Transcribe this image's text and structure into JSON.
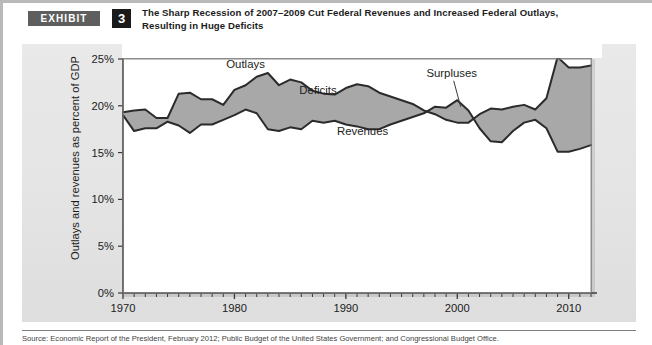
{
  "exhibit": {
    "tag_label": "EXHIBIT",
    "number": "3",
    "title_line1": "The Sharp Recession of 2007–2009 Cut Federal Revenues and Increased Federal Outlays,",
    "title_line2": "Resulting in Huge Deficits"
  },
  "source": {
    "text": "Source: Economic Report of the President, February 2012; Public Budget of the United States Government; and Congressional Budget Office."
  },
  "colors": {
    "fill_gray": "#a8a8a8",
    "line_dark": "#2b2b2b",
    "panel_bg": "#e6e6e6",
    "plot_bg": "#ffffff",
    "frame": "#8c8c8c",
    "tag_bg": "#5e5e5e",
    "num_bg": "#1a1a1a"
  },
  "chart_data": {
    "type": "area",
    "title": "The Sharp Recession of 2007–2009 Cut Federal Revenues and Increased Federal Outlays, Resulting in Huge Deficits",
    "xlabel": "",
    "ylabel": "Outlays and revenues as percent of GDP",
    "xlim": [
      1970,
      2012
    ],
    "ylim": [
      0,
      25
    ],
    "ytick_values": [
      0,
      5,
      10,
      15,
      20,
      25
    ],
    "ytick_labels": [
      "0%",
      "5%",
      "10%",
      "15%",
      "20%",
      "25%"
    ],
    "xtick_values": [
      1970,
      1980,
      1990,
      2000,
      2010
    ],
    "xtick_labels": [
      "1970",
      "1980",
      "1990",
      "2000",
      "2010"
    ],
    "xtick_minor_step": 1,
    "grid": false,
    "legend": "inline-annotations",
    "annotations": [
      {
        "label": "Outlays",
        "x": 1981.0,
        "y": 24.0
      },
      {
        "label": "Deficits",
        "x": 1987.5,
        "y": 21.3
      },
      {
        "label": "Revenues",
        "x": 1991.5,
        "y": 16.9
      },
      {
        "label": "Surpluses",
        "x": 1999.5,
        "y": 23.1,
        "leader_to": {
          "x": 2000.3,
          "y": 19.9
        }
      }
    ],
    "x": [
      1970,
      1971,
      1972,
      1973,
      1974,
      1975,
      1976,
      1977,
      1978,
      1979,
      1980,
      1981,
      1982,
      1983,
      1984,
      1985,
      1986,
      1987,
      1988,
      1989,
      1990,
      1991,
      1992,
      1993,
      1994,
      1995,
      1996,
      1997,
      1998,
      1999,
      2000,
      2001,
      2002,
      2003,
      2004,
      2005,
      2006,
      2007,
      2008,
      2009,
      2010,
      2011,
      2012
    ],
    "series": [
      {
        "name": "Outlays",
        "values": [
          19.3,
          19.5,
          19.6,
          18.7,
          18.7,
          21.3,
          21.4,
          20.7,
          20.7,
          20.1,
          21.7,
          22.2,
          23.1,
          23.5,
          22.2,
          22.8,
          22.5,
          21.6,
          21.3,
          21.2,
          21.9,
          22.3,
          22.1,
          21.4,
          21.0,
          20.6,
          20.2,
          19.5,
          19.1,
          18.5,
          18.2,
          18.2,
          19.1,
          19.7,
          19.6,
          19.9,
          20.1,
          19.6,
          20.8,
          25.2,
          24.1,
          24.1,
          24.3
        ]
      },
      {
        "name": "Revenues",
        "values": [
          19.0,
          17.3,
          17.6,
          17.6,
          18.3,
          17.9,
          17.1,
          18.0,
          18.0,
          18.5,
          19.0,
          19.6,
          19.2,
          17.5,
          17.3,
          17.7,
          17.5,
          18.4,
          18.2,
          18.4,
          18.0,
          17.8,
          17.5,
          17.5,
          18.0,
          18.4,
          18.8,
          19.2,
          19.9,
          19.8,
          20.6,
          19.5,
          17.6,
          16.2,
          16.1,
          17.3,
          18.2,
          18.5,
          17.6,
          15.1,
          15.1,
          15.4,
          15.8
        ]
      }
    ]
  }
}
